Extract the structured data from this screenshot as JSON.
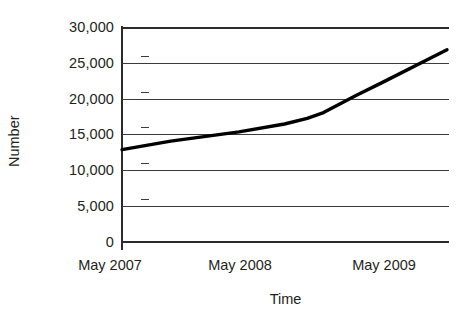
{
  "chart_data": {
    "type": "line",
    "title": "",
    "subtitle": "",
    "xlabel": "Time",
    "ylabel": "Number",
    "grid": true,
    "legend": false,
    "legend_position": "none",
    "line_color": "#000000",
    "grid_color": "#3b3b3b",
    "axis_color": "#2a2a2a",
    "background_color": "#ffffff",
    "ylim": [
      0,
      30000
    ],
    "y_ticks": [
      0,
      5000,
      10000,
      15000,
      20000,
      25000,
      30000
    ],
    "y_tick_labels": [
      "0",
      "5,000",
      "10,000",
      "15,000",
      "20,000",
      "25,000",
      "30,000"
    ],
    "x_tick_labels": [
      "May 2007",
      "May 2008",
      "May 2009"
    ],
    "x_categories": [
      "May 2007",
      "May 2008",
      "May 2009"
    ],
    "series": [
      {
        "name": "Number",
        "x": [
          "May 2007",
          "May 2008",
          "May 2009"
        ],
        "points": [
          {
            "x_label": "May 2007",
            "x_frac": 0.0,
            "value": 12800
          },
          {
            "x_label": "",
            "x_frac": 0.15,
            "value": 14000
          },
          {
            "x_label": "May 2008",
            "x_frac": 0.36,
            "value": 15300
          },
          {
            "x_label": "",
            "x_frac": 0.5,
            "value": 16400
          },
          {
            "x_label": "",
            "x_frac": 0.57,
            "value": 17200
          },
          {
            "x_label": "",
            "x_frac": 0.62,
            "value": 18000
          },
          {
            "x_label": "",
            "x_frac": 0.72,
            "value": 20400
          },
          {
            "x_label": "May 2009",
            "x_frac": 0.8,
            "value": 22200
          },
          {
            "x_label": "",
            "x_frac": 1.0,
            "value": 26800
          }
        ],
        "values": [
          12800,
          15300,
          22200
        ]
      }
    ]
  },
  "axis": {
    "y_title": "Number",
    "x_title": "Time",
    "y_tick_labels": [
      "30,000",
      "25,000",
      "20,000",
      "15,000",
      "10,000",
      "5,000",
      "0"
    ],
    "x_tick_labels": [
      "May 2007",
      "May 2008",
      "May 2009"
    ]
  }
}
